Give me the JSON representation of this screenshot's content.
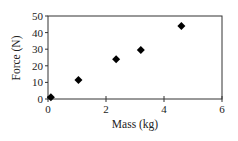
{
  "chart_data": {
    "type": "scatter",
    "title": "",
    "xlabel": "Mass (kg)",
    "ylabel": "Force (N)",
    "xlim": [
      0,
      6
    ],
    "ylim": [
      0,
      50
    ],
    "xticks": [
      0,
      2,
      4,
      6
    ],
    "yticks": [
      0,
      10,
      20,
      30,
      40,
      50
    ],
    "grid": false,
    "legend": null,
    "marker": "diamond",
    "marker_color": "#000000",
    "series": [
      {
        "name": "Force vs Mass",
        "x": [
          0.1,
          1.05,
          2.35,
          3.2,
          4.6
        ],
        "y": [
          1,
          11.5,
          24,
          29.5,
          44
        ]
      }
    ]
  }
}
